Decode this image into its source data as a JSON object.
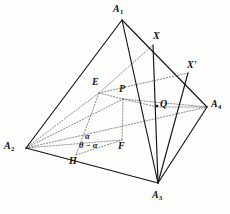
{
  "figure": {
    "kind": "geometry-diagram",
    "stroke_color": "#1a1a1a",
    "dotted_color": "#6b6b6b",
    "background": "#fdfdfc",
    "width": 230,
    "height": 214
  },
  "vertices": [
    {
      "id": "A1",
      "label": "A",
      "sub": "1",
      "x": 122,
      "y": 20,
      "lx": 113,
      "ly": 5
    },
    {
      "id": "A2",
      "label": "A",
      "sub": "2",
      "x": 26,
      "y": 148,
      "lx": 4,
      "ly": 142
    },
    {
      "id": "A3",
      "label": "A",
      "sub": "3",
      "x": 158,
      "y": 183,
      "lx": 152,
      "ly": 190
    },
    {
      "id": "A4",
      "label": "A",
      "sub": "4",
      "x": 207,
      "y": 107,
      "lx": 211,
      "ly": 100
    }
  ],
  "points": [
    {
      "id": "X",
      "label": "X",
      "prime": "",
      "x": 153,
      "y": 45,
      "lx": 154,
      "ly": 32,
      "dot": false
    },
    {
      "id": "Xp",
      "label": "X",
      "prime": "'",
      "x": 188,
      "y": 73,
      "lx": 188,
      "ly": 61,
      "dot": false
    },
    {
      "id": "E",
      "label": "E",
      "prime": "",
      "x": 99,
      "y": 93,
      "lx": 93,
      "ly": 78,
      "dot": false
    },
    {
      "id": "P",
      "label": "P",
      "prime": "",
      "x": 123,
      "y": 99,
      "lx": 120,
      "ly": 85,
      "dot": false
    },
    {
      "id": "Q",
      "label": "Q",
      "prime": "",
      "x": 157,
      "y": 107,
      "lx": 161,
      "ly": 99,
      "dot": true
    },
    {
      "id": "F",
      "label": "F",
      "prime": "",
      "x": 122,
      "y": 140,
      "lx": 119,
      "ly": 141
    },
    {
      "id": "H",
      "label": "H",
      "prime": "",
      "x": 76,
      "y": 155,
      "lx": 70,
      "ly": 156
    }
  ],
  "angles": [
    {
      "id": "alpha",
      "text": "α",
      "lx": 85,
      "ly": 133
    },
    {
      "id": "theta-minus-alpha",
      "text": "θ − α",
      "lx": 80,
      "ly": 142
    }
  ],
  "solid_edges": [
    {
      "name": "edge-A1-A2",
      "from": "A1",
      "to": "A2"
    },
    {
      "name": "edge-A1-A3",
      "from": "A1",
      "to": "A3"
    },
    {
      "name": "edge-A1-A4",
      "from": "A1",
      "to": "A4"
    },
    {
      "name": "edge-A2-A3",
      "from": "A2",
      "to": "A3"
    },
    {
      "name": "edge-A3-A4",
      "from": "A3",
      "to": "A4"
    },
    {
      "name": "segment-X-A3",
      "from": "X",
      "to": "A3"
    },
    {
      "name": "segment-Xp-A3",
      "from": "Xp",
      "to": "A3"
    }
  ],
  "dotted_edges": [
    {
      "name": "dotted-A2-A4",
      "from": "A2",
      "to": "A4"
    },
    {
      "name": "dotted-A2-E",
      "from": "A2",
      "to": "E"
    },
    {
      "name": "dotted-A2-P",
      "from": "A2",
      "to": "P"
    },
    {
      "name": "dotted-A2-F",
      "from": "A2",
      "to": "F"
    },
    {
      "name": "dotted-E-P",
      "from": "E",
      "to": "P"
    },
    {
      "name": "dotted-E-H",
      "from": "E",
      "to": "H"
    },
    {
      "name": "dotted-P-F",
      "from": "P",
      "to": "F"
    },
    {
      "name": "dotted-H-F",
      "from": "H",
      "to": "F"
    },
    {
      "name": "dotted-P-Q",
      "from": "P",
      "to": "Q"
    },
    {
      "name": "dotted-E-X",
      "from": "E",
      "to": "X"
    },
    {
      "name": "dotted-P-A4",
      "from": "P",
      "to": "A4"
    },
    {
      "name": "dotted-Q-A4",
      "from": "Q",
      "to": "A4"
    }
  ]
}
